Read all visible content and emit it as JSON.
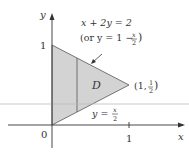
{
  "diagram": {
    "region_label": "D",
    "axes": {
      "x_label": "x",
      "y_label": "y",
      "origin_label": "0",
      "x_tick_label": "1",
      "y_tick_label": "1"
    },
    "upper_curve": {
      "equation": "x + 2y = 2",
      "alt_open": "(or y = 1 −",
      "alt_frac_num": "x",
      "alt_frac_den": "2",
      "alt_close": ")"
    },
    "lower_curve": {
      "lhs": "y =",
      "frac_num": "x",
      "frac_den": "2"
    },
    "vertex": {
      "open": "(1,",
      "frac_num": "1",
      "frac_den": "2",
      "close": ")"
    },
    "colors": {
      "region_fill": "#d3d3d3",
      "axis": "#333333",
      "guide_line": "#bbbbbb"
    }
  }
}
